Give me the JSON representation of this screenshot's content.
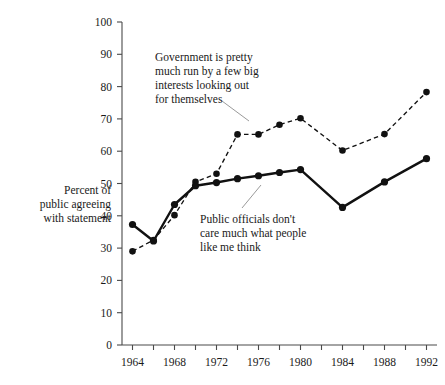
{
  "chart_data": {
    "type": "line",
    "title": "",
    "xlabel": "",
    "ylabel": "Percent of public agreeing with statement",
    "xlim": [
      1963,
      1993
    ],
    "ylim": [
      0,
      100
    ],
    "grid": false,
    "legend": "annotations-on-plot",
    "x": [
      1964,
      1966,
      1968,
      1970,
      1972,
      1974,
      1976,
      1978,
      1980,
      1984,
      1988,
      1992
    ],
    "xtick_labels": [
      "1964",
      "1968",
      "1972",
      "1976",
      "1980",
      "1984",
      "1988",
      "1992"
    ],
    "xtick_values": [
      1964,
      1968,
      1972,
      1976,
      1980,
      1984,
      1988,
      1992
    ],
    "ytick_labels": [
      "0",
      "10",
      "20",
      "30",
      "40",
      "50",
      "60",
      "70",
      "80",
      "90",
      "100"
    ],
    "ytick_values": [
      0,
      10,
      20,
      30,
      40,
      50,
      60,
      70,
      80,
      90,
      100
    ],
    "series": [
      {
        "name": "Government is pretty much run by a few big interests looking out for themselves",
        "style": "dashed",
        "marker": "filled-circle",
        "values": [
          29,
          32.5,
          40.2,
          50.5,
          53,
          65.2,
          65.2,
          68.2,
          70.2,
          60.2,
          65.3,
          78.3
        ]
      },
      {
        "name": "Public officials don't care much what people like me think",
        "style": "solid",
        "marker": "filled-circle",
        "values": [
          37.3,
          32.2,
          43.5,
          49.3,
          50.3,
          51.5,
          52.4,
          53.4,
          54.3,
          42.6,
          50.5,
          57.7
        ]
      }
    ],
    "annotations": [
      {
        "id": "annot-big-interests",
        "lines": [
          "Government is pretty",
          "much run by a few big",
          "interests looking out",
          "for themselves"
        ]
      },
      {
        "id": "annot-public-officials",
        "lines": [
          "Public officials don't",
          "care much what people",
          "like me think"
        ]
      }
    ],
    "axis_title_lines": [
      "Percent of",
      "public agreeing",
      "with statement"
    ],
    "colors": {
      "line": "#111111",
      "axis": "#4a4a4a",
      "text": "#1a1a1a",
      "leader": "#8a8a8a",
      "background": "#ffffff"
    }
  }
}
